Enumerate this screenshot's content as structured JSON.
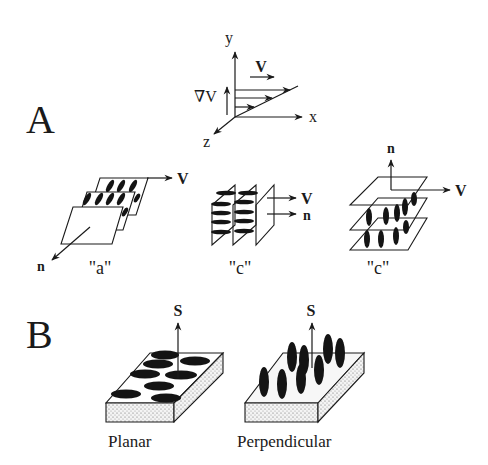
{
  "panels": {
    "A": {
      "label": "A",
      "axes": {
        "y": "y",
        "x": "x",
        "z": "z",
        "velocity": "V",
        "gradient": "∇V"
      },
      "alignments": [
        {
          "label": "\"a\"",
          "vector1": "V",
          "vector2": "n"
        },
        {
          "label": "\"b\"",
          "vector1": "V",
          "vector2": "n"
        },
        {
          "label": "\"c\"",
          "vector1": "V",
          "vector2": "n"
        }
      ]
    },
    "B": {
      "label": "B",
      "substrates": [
        {
          "label": "Planar",
          "vector": "S"
        },
        {
          "label": "Perpendicular",
          "vector": "S"
        }
      ]
    }
  },
  "colors": {
    "ink": "#1a1a1a",
    "background": "#ffffff"
  }
}
